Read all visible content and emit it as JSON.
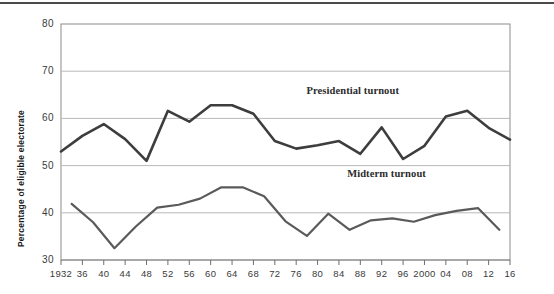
{
  "chart_data": {
    "type": "line",
    "title": "",
    "subtitle": "",
    "xlabel": "",
    "ylabel": "Percentage of eligible electorate",
    "ylim": [
      30,
      80
    ],
    "ytick_labels": [
      "80",
      "70",
      "60",
      "50",
      "40",
      "30"
    ],
    "ytick_values": [
      80,
      70,
      60,
      50,
      40,
      30
    ],
    "grid": "horizontal",
    "legend_position": "inline-annotation",
    "xtick_labels": [
      "1932",
      "36",
      "40",
      "44",
      "48",
      "52",
      "56",
      "60",
      "64",
      "68",
      "72",
      "76",
      "80",
      "84",
      "88",
      "92",
      "96",
      "2000",
      "04",
      "08",
      "12",
      "16"
    ],
    "xtick_values": [
      1932,
      1936,
      1940,
      1944,
      1948,
      1952,
      1956,
      1960,
      1964,
      1968,
      1972,
      1976,
      1980,
      1984,
      1988,
      1992,
      1996,
      2000,
      2004,
      2008,
      2012,
      2016
    ],
    "series": [
      {
        "name": "Presidential turnout",
        "color": "#3d3d3d",
        "x": [
          1932,
          1936,
          1940,
          1944,
          1948,
          1952,
          1956,
          1960,
          1964,
          1968,
          1972,
          1976,
          1980,
          1984,
          1988,
          1992,
          1996,
          2000,
          2004,
          2008,
          2012,
          2016
        ],
        "values": [
          53.0,
          56.3,
          58.8,
          55.6,
          51.0,
          61.6,
          59.3,
          62.8,
          62.8,
          61.0,
          55.2,
          53.6,
          54.3,
          55.2,
          52.5,
          58.1,
          51.4,
          54.2,
          60.4,
          61.6,
          58.0,
          55.5
        ]
      },
      {
        "name": "Midterm turnout",
        "color": "#5a5a5a",
        "x": [
          1934,
          1938,
          1942,
          1946,
          1950,
          1954,
          1958,
          1962,
          1966,
          1970,
          1974,
          1978,
          1982,
          1986,
          1990,
          1994,
          1998,
          2002,
          2006,
          2010,
          2014
        ],
        "values": [
          41.9,
          38.0,
          32.5,
          37.1,
          41.1,
          41.7,
          43.0,
          45.4,
          45.4,
          43.5,
          38.2,
          35.1,
          39.8,
          36.4,
          38.4,
          38.8,
          38.1,
          39.5,
          40.4,
          41.0,
          36.4
        ]
      }
    ],
    "annotations": [
      {
        "text": "Presidential turnout",
        "x": 2000,
        "y": 65.5
      },
      {
        "text": "Midterm turnout",
        "x": 2002,
        "y": 48.0
      }
    ]
  }
}
